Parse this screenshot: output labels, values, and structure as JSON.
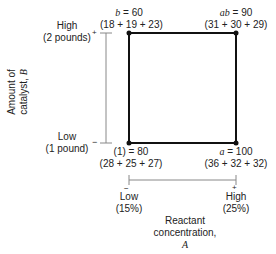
{
  "diagram": {
    "type": "2^2 factorial design square",
    "factor_b": {
      "axis_label_line1": "Amount of",
      "axis_label_line2": "catalyst, ",
      "axis_symbol": "B",
      "high_label": "High",
      "high_value": "(2 pounds)",
      "high_sign": "+",
      "low_label": "Low",
      "low_value": "(1 pound)",
      "low_sign": "−"
    },
    "factor_a": {
      "axis_label_line1": "Reactant",
      "axis_label_line2": "concentration,",
      "axis_symbol": "A",
      "low_sign": "−",
      "low_label": "Low",
      "low_value": "(15%)",
      "high_sign": "+",
      "high_label": "High",
      "high_value": "(25%)"
    },
    "corners": [
      {
        "id": "b",
        "sym": "b",
        "eq": " = 60",
        "sum": "(18 + 19 + 23)"
      },
      {
        "id": "ab",
        "sym": "ab",
        "eq": " = 90",
        "sum": "(31 + 30 + 29)"
      },
      {
        "id": "one",
        "sym": "(1)",
        "eq": " = 80",
        "sum": "(28 + 25 + 27)"
      },
      {
        "id": "a",
        "sym": "a",
        "eq": " = 100",
        "sum": "(36 + 32 + 32)"
      }
    ],
    "colors": {
      "square": "#111111",
      "axis": "#888888",
      "text": "#222222"
    }
  }
}
